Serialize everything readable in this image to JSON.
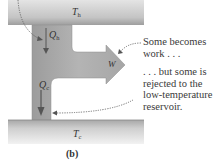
{
  "diagram": {
    "hot_reservoir": {
      "symbol": "T",
      "subscript": "h"
    },
    "cold_reservoir": {
      "symbol": "T",
      "subscript": "c"
    },
    "heat_in": {
      "symbol": "Q",
      "subscript": "h"
    },
    "heat_out": {
      "symbol": "Q",
      "subscript": "c"
    },
    "work": {
      "symbol": "W"
    },
    "annotation_work": [
      "Some becomes",
      "work . . ."
    ],
    "annotation_rejected": [
      ". . . but some is",
      "rejected to the",
      "low-temperature",
      "reservoir."
    ],
    "caption": "(b)"
  },
  "colors": {
    "reservoir_light": "#d9d9d9",
    "reservoir_dark": "#9a9a9a",
    "engine_fill": "#a8a8a8",
    "text": "#3a3a3a"
  }
}
